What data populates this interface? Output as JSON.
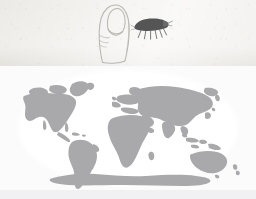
{
  "figure": {
    "panels": [
      {
        "id": "scale-panel",
        "caption": "Fingertip shown with insect at actual size",
        "background_color": "#eceae6",
        "items": [
          {
            "name": "fingertip-drawing",
            "label": "Human fingertip outline",
            "style": "pencil line drawing",
            "stroke_color": "#b9b6b0",
            "position": {
              "x": 88,
              "y": 2,
              "width": 52,
              "height": 62
            }
          },
          {
            "name": "insect-silhouette",
            "label": "Insect silhouette",
            "style": "filled silhouette",
            "fill_color": "#555556",
            "leg_count": 6,
            "position": {
              "x": 128,
              "y": 10,
              "width": 48,
              "height": 36
            }
          }
        ]
      },
      {
        "id": "map-panel",
        "caption": "World distribution map",
        "background_color": "#fbfbfc",
        "projection": "elliptical (Mollweide-style)",
        "ocean_color": "#ffffff",
        "land_color": "#a9a9ab",
        "bottom_band_color": "#f1f1f3"
      }
    ],
    "colors": {
      "paper": "#eceae6",
      "pencil": "#b9b6b0",
      "insect": "#555556",
      "land": "#a9a9ab",
      "ocean": "#ffffff",
      "page": "#fbfbfc"
    },
    "landmasses": [
      "North America",
      "Greenland",
      "South America",
      "Europe",
      "Africa",
      "Asia",
      "Indonesia",
      "Australia",
      "New Zealand",
      "Antarctica"
    ]
  }
}
